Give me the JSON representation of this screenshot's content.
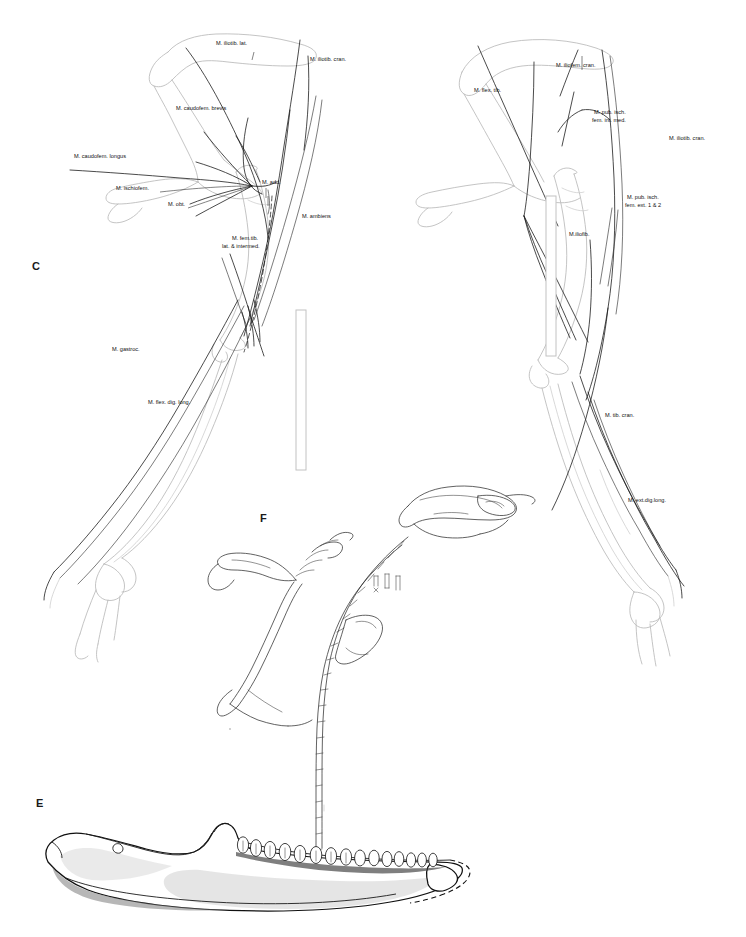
{
  "figure": {
    "background_color": "#ffffff",
    "ink_color": "#1d1d1d",
    "bone_outline_color": "#b9b9b9"
  },
  "panels": [
    {
      "id": "C",
      "letter": "C",
      "x": 32,
      "y": 270,
      "description": "Lateral view of pelvis and hindlimb with superficial musculature"
    },
    {
      "id": "F",
      "letter": "F",
      "x": 260,
      "y": 522,
      "description": "Disarticulated skeletal elements: skull, vertebral series and limb bones"
    },
    {
      "id": "E",
      "letter": "E",
      "x": 36,
      "y": 807,
      "description": "Stippled mandible in lateral view with tooth row"
    }
  ],
  "panel_c": {
    "letter": "C",
    "labels": [
      {
        "id": "iliotib-lat",
        "text": "M. iliotib. lat.",
        "x": 216,
        "y": 45,
        "anchor": "start"
      },
      {
        "id": "iliotib-cran",
        "text": "M. iliotib. cran.",
        "x": 310,
        "y": 61,
        "anchor": "start"
      },
      {
        "id": "caudofem-brevis",
        "text": "M. caudofem. brevis",
        "x": 176,
        "y": 110,
        "anchor": "start"
      },
      {
        "id": "caudofem-longus",
        "text": "M. caudofem. longus",
        "x": 74,
        "y": 158,
        "anchor": "start"
      },
      {
        "id": "ischiofem",
        "text": "M. ischiofem.",
        "x": 116,
        "y": 190,
        "anchor": "start"
      },
      {
        "id": "obt",
        "text": "M. obt.",
        "x": 168,
        "y": 206,
        "anchor": "start"
      },
      {
        "id": "add",
        "text": "M. add.",
        "x": 262,
        "y": 184,
        "anchor": "start"
      },
      {
        "id": "ambiens",
        "text": "M. ambiens",
        "x": 302,
        "y": 218,
        "anchor": "start"
      },
      {
        "id": "femtib-1",
        "text": "M. fem.tib.",
        "x": 232,
        "y": 240,
        "anchor": "start"
      },
      {
        "id": "femtib-2",
        "text": "lat. & intermed.",
        "x": 222,
        "y": 248,
        "anchor": "start"
      },
      {
        "id": "gastroc",
        "text": "M. gastroc.",
        "x": 112,
        "y": 351,
        "anchor": "start"
      },
      {
        "id": "flex-dig-long",
        "text": "M. flex. dig. long.",
        "x": 148,
        "y": 404,
        "anchor": "start"
      }
    ],
    "scale_bar": {
      "x": 296,
      "y": 310,
      "width": 10,
      "height": 160
    }
  },
  "panel_d": {
    "labels": [
      {
        "id": "iliofem-cran",
        "text": "M. iliofem. cran.",
        "x": 556,
        "y": 67,
        "anchor": "start"
      },
      {
        "id": "flex-tib",
        "text": "M. flex. tib.",
        "x": 474,
        "y": 92,
        "anchor": "start"
      },
      {
        "id": "pub-isch-int-1",
        "text": "M. pub. isch.",
        "x": 594,
        "y": 114,
        "anchor": "start"
      },
      {
        "id": "pub-isch-int-2",
        "text": "fem. int. med.",
        "x": 592,
        "y": 122,
        "anchor": "start"
      },
      {
        "id": "iliotib-cran-r",
        "text": "M. iliotib. cran.",
        "x": 669,
        "y": 140,
        "anchor": "start"
      },
      {
        "id": "pub-isch-ext-1",
        "text": "M. pub. isch.",
        "x": 627,
        "y": 199,
        "anchor": "start"
      },
      {
        "id": "pub-isch-ext-2",
        "text": "fem. ext. 1 & 2",
        "x": 625,
        "y": 207,
        "anchor": "start"
      },
      {
        "id": "iliofib",
        "text": "M.iliofib.",
        "x": 569,
        "y": 236,
        "anchor": "start"
      },
      {
        "id": "tib-cran",
        "text": "M. tib. cran.",
        "x": 605,
        "y": 417,
        "anchor": "start"
      },
      {
        "id": "ext-dig-long",
        "text": "M. ext.dig.long.",
        "x": 628,
        "y": 502,
        "anchor": "start"
      }
    ],
    "scale_bar": {
      "x": 546,
      "y": 196,
      "width": 10,
      "height": 160
    }
  },
  "panel_f": {
    "letter": "F",
    "elements": [
      {
        "id": "skull",
        "description": "skull in dorsolateral view"
      },
      {
        "id": "vertebral-column",
        "description": "articulated caudal vertebral series, 21 segments"
      },
      {
        "id": "scapula-coracoid",
        "description": "scapulocoracoid blade"
      },
      {
        "id": "limb-fragment",
        "description": "isolated limb bone fragment"
      },
      {
        "id": "small-bones",
        "description": "cluster of small isolated ossicles"
      }
    ]
  },
  "panel_e": {
    "letter": "E",
    "description": "Mandible, lateral view, stippled shading",
    "tooth_count": 15,
    "reconstructed_margin": "dashed posterior outline"
  }
}
